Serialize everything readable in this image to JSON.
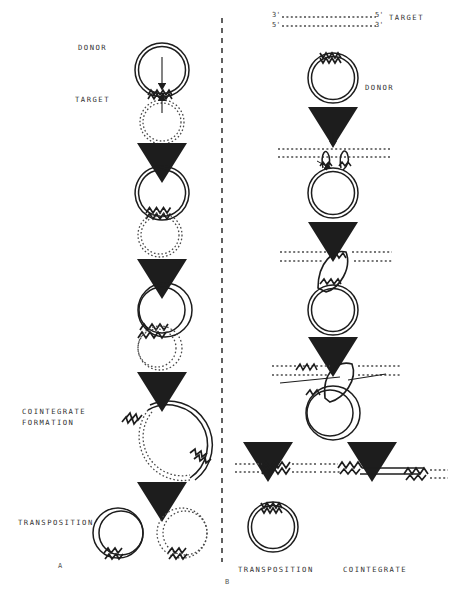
{
  "figure": {
    "title_fragment": "",
    "panels": [
      {
        "id": "A",
        "id_label": "A",
        "description": "Cointegrate pathway via circular donor and circular target",
        "labels": {
          "donor": "DONOR",
          "target": "TARGET",
          "cointegrate_formation_line1": "COINTEGRATE",
          "cointegrate_formation_line2": "FORMATION",
          "transposition": "TRANSPOSITION"
        }
      },
      {
        "id": "B",
        "id_label": "B",
        "description": "Strand transfer pathway with linear target DNA and circular donor",
        "labels": {
          "target": "TARGET",
          "donor": "DONOR",
          "transposition": "TRANSPOSITION",
          "cointegrate": "COINTEGRATE",
          "three_prime_top": "3'",
          "five_prime_top_right": "5'",
          "five_prime_bottom": "5'",
          "three_prime_bottom_right": "3'"
        }
      }
    ],
    "colors": {
      "ink": "#2b2b2b",
      "label": "#333333",
      "dotted": "#4a4a4a",
      "background": "#ffffff"
    },
    "legend_semantics": {
      "solid_line": "donor DNA",
      "dotted_line": "target DNA",
      "zigzag": "transposable element"
    }
  }
}
